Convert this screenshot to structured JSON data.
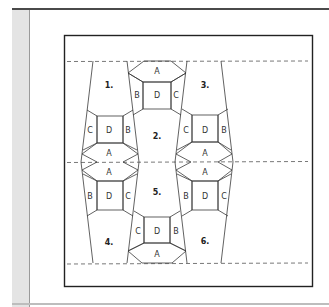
{
  "diagram": {
    "title": "",
    "pieces": [
      {
        "id": "piece-1",
        "label": "1."
      },
      {
        "id": "piece-2",
        "label": "2."
      },
      {
        "id": "piece-3",
        "label": "3."
      },
      {
        "id": "piece-4",
        "label": "4."
      },
      {
        "id": "piece-5",
        "label": "5."
      },
      {
        "id": "piece-6",
        "label": "6."
      }
    ],
    "blocks": [
      {
        "id": "top-center",
        "a": "A",
        "b": "B",
        "c": "C",
        "d": "D"
      },
      {
        "id": "left-upper",
        "a": "A",
        "b": "B",
        "c": "C",
        "d": "D"
      },
      {
        "id": "right-upper",
        "a": "A",
        "b": "B",
        "c": "C",
        "d": "D"
      },
      {
        "id": "left-lower",
        "a": "A",
        "b": "B",
        "c": "C",
        "d": "D"
      },
      {
        "id": "right-lower",
        "a": "A",
        "b": "B",
        "c": "C",
        "d": "D"
      },
      {
        "id": "bottom-center",
        "a": "A",
        "b": "B",
        "c": "C",
        "d": "D"
      }
    ],
    "colors": {
      "line": "#3a3a3a",
      "dash": "#555555",
      "border": "#222222",
      "strip": "#e4e4e4"
    }
  }
}
